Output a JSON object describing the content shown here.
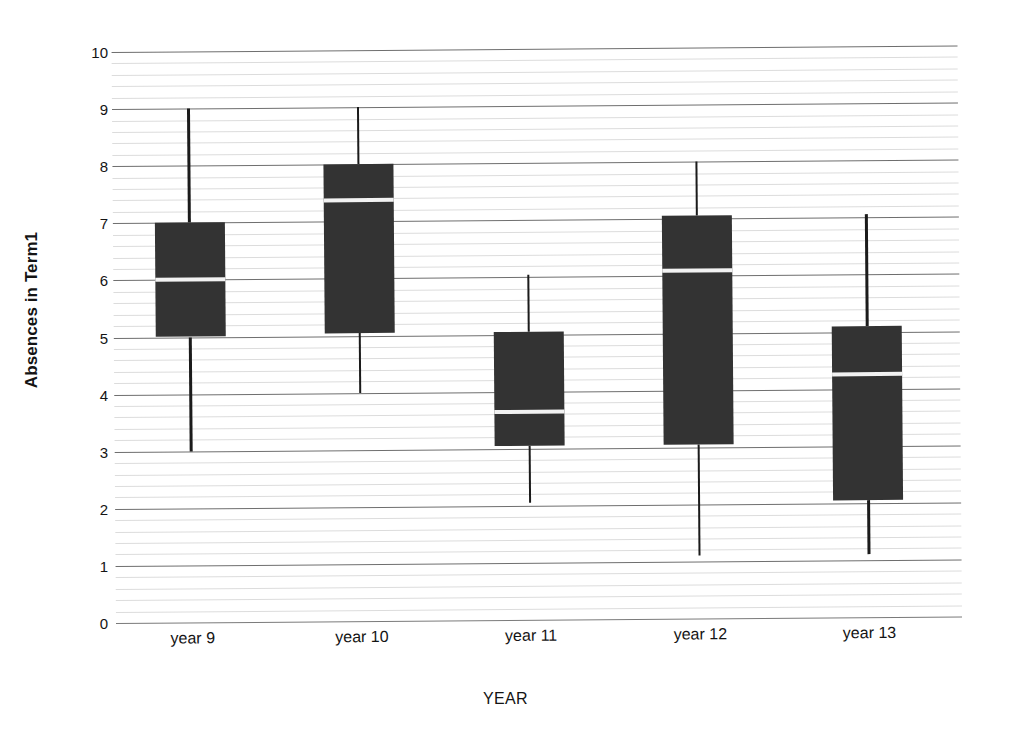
{
  "chart_data": {
    "type": "box",
    "title": "",
    "xlabel": "YEAR",
    "ylabel": "Absences in Term1",
    "categories": [
      "year 9",
      "year 10",
      "year 11",
      "year 12",
      "year 13"
    ],
    "ylim": [
      0,
      10
    ],
    "y_ticks": [
      0,
      1,
      2,
      3,
      4,
      5,
      6,
      7,
      8,
      9,
      10
    ],
    "y_tick_labels": [
      "0",
      "1",
      "2",
      "3",
      "4",
      "5",
      "6",
      "7",
      "8",
      "9",
      "10"
    ],
    "minor_gridlines_per_interval": 4,
    "grid": true,
    "legend": "none",
    "box_color": "#333333",
    "median_color": "#f2f2f2",
    "whisker_color": "#1b1b1b",
    "boxes": [
      {
        "category": "year 9",
        "whisker_low": 3.0,
        "q1": 5.0,
        "median": 6.0,
        "q3": 7.0,
        "whisker_high": 9.0
      },
      {
        "category": "year 10",
        "whisker_low": 4.0,
        "q1": 5.05,
        "median": 7.38,
        "q3": 8.0,
        "whisker_high": 9.0
      },
      {
        "category": "year 11",
        "whisker_low": 2.05,
        "q1": 3.05,
        "median": 3.65,
        "q3": 5.05,
        "whisker_high": 6.05
      },
      {
        "category": "year 12",
        "whisker_low": 1.1,
        "q1": 3.05,
        "median": 6.1,
        "q3": 7.05,
        "whisker_high": 8.0
      },
      {
        "category": "year 13",
        "whisker_low": 1.1,
        "q1": 2.05,
        "median": 4.25,
        "q3": 5.1,
        "whisker_high": 7.05
      }
    ]
  },
  "axes": {
    "y_title": "Absences in Term1",
    "x_title": "YEAR"
  }
}
